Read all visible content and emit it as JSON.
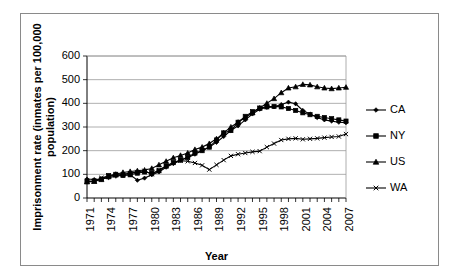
{
  "chart_data": {
    "type": "line",
    "title": "",
    "xlabel": "Year",
    "ylabel": "Imprisonment rate (inmates per 100,000 population)",
    "ylabel_line1": "Imprisonment  rate (inmates per 100,000",
    "ylabel_line2": "population)",
    "xlim": [
      1971,
      2007
    ],
    "ylim": [
      0,
      600
    ],
    "ytick_values": [
      0,
      100,
      200,
      300,
      400,
      500,
      600
    ],
    "ytick_labels": [
      "0",
      "100",
      "200",
      "300",
      "400",
      "500",
      "600"
    ],
    "xtick_labels": [
      "1971",
      "1974",
      "1977",
      "1980",
      "1983",
      "1986",
      "1989",
      "1992",
      "1995",
      "1998",
      "2001",
      "2004",
      "2007"
    ],
    "xtick_values": [
      1971,
      1974,
      1977,
      1980,
      1983,
      1986,
      1989,
      1992,
      1995,
      1998,
      2001,
      2004,
      2007
    ],
    "x": [
      1971,
      1972,
      1973,
      1974,
      1975,
      1976,
      1977,
      1978,
      1979,
      1980,
      1981,
      1982,
      1983,
      1984,
      1985,
      1986,
      1987,
      1988,
      1989,
      1990,
      1991,
      1992,
      1993,
      1994,
      1995,
      1996,
      1997,
      1998,
      1999,
      2000,
      2001,
      2002,
      2003,
      2004,
      2005,
      2006,
      2007
    ],
    "grid": "horizontal",
    "legend_position": "right",
    "series": [
      {
        "name": "CA",
        "marker": "diamond",
        "values": [
          80,
          78,
          80,
          86,
          92,
          96,
          98,
          75,
          84,
          98,
          110,
          130,
          145,
          160,
          170,
          185,
          200,
          215,
          235,
          260,
          285,
          305,
          330,
          355,
          375,
          383,
          385,
          395,
          405,
          398,
          370,
          355,
          340,
          330,
          325,
          320,
          318
        ]
      },
      {
        "name": "NY",
        "marker": "square",
        "values": [
          70,
          72,
          80,
          95,
          100,
          95,
          98,
          105,
          110,
          105,
          115,
          135,
          150,
          160,
          172,
          190,
          200,
          215,
          245,
          275,
          285,
          320,
          345,
          365,
          380,
          385,
          387,
          385,
          378,
          370,
          360,
          352,
          345,
          340,
          335,
          330,
          325
        ]
      },
      {
        "name": "US",
        "marker": "triangle",
        "values": [
          68,
          70,
          78,
          90,
          100,
          108,
          112,
          115,
          118,
          125,
          140,
          155,
          170,
          180,
          190,
          205,
          215,
          230,
          250,
          275,
          300,
          320,
          340,
          360,
          380,
          400,
          420,
          445,
          465,
          470,
          480,
          478,
          470,
          465,
          462,
          465,
          468
        ]
      },
      {
        "name": "WA",
        "marker": "cross",
        "values": [
          72,
          70,
          85,
          92,
          95,
          100,
          105,
          110,
          115,
          100,
          118,
          135,
          148,
          158,
          155,
          148,
          138,
          120,
          140,
          160,
          178,
          185,
          190,
          195,
          198,
          215,
          230,
          245,
          250,
          252,
          248,
          250,
          252,
          255,
          258,
          260,
          270
        ]
      }
    ]
  },
  "legend": {
    "entries": [
      {
        "label": "CA"
      },
      {
        "label": "NY"
      },
      {
        "label": "US"
      },
      {
        "label": "WA"
      }
    ]
  }
}
